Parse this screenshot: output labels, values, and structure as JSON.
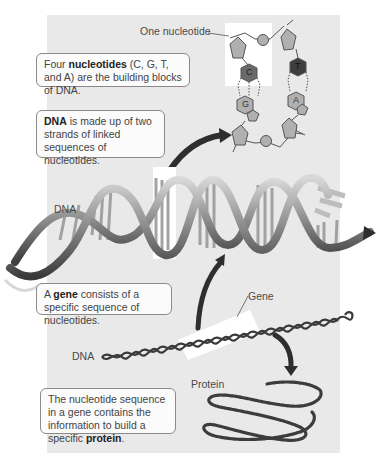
{
  "labels": {
    "one_nucleotide": "One nucleotide",
    "dna_main": "DNA",
    "dna_lower": "DNA",
    "gene": "Gene",
    "protein": "Protein"
  },
  "nucleotides": {
    "c": "C",
    "g": "G",
    "t": "T",
    "a": "A"
  },
  "boxes": {
    "nucleotides": {
      "pre": "Four ",
      "bold": "nucleotides",
      "post": " (C, G, T, and A) are the building blocks of DNA."
    },
    "dna": {
      "pre": "",
      "bold": "DNA",
      "post": " is made up of two strands of linked sequences of nucleotides."
    },
    "gene": {
      "pre": "A ",
      "bold": "gene",
      "post": " consists of a specific sequence of nucleotides."
    },
    "protein": {
      "pre": "The nucleotide sequence in a gene contains the information to build a specific ",
      "bold": "protein",
      "post": "."
    }
  },
  "colors": {
    "panel": "#e9e9e9",
    "arrow": "#2e2e2e",
    "base_light": "#b5b5b5",
    "base_dark": "#4a4a4a",
    "helix": "#8c8c8c"
  }
}
